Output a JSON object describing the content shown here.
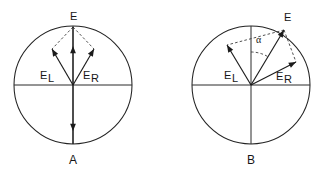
{
  "figure": {
    "background_color": "#ffffff",
    "line_color": "#1b1b1b",
    "dashed_color": "#3d3d3d",
    "width": 328,
    "height": 176,
    "panels": [
      {
        "id": "panel-a",
        "caption": "A",
        "caption_x": 73,
        "caption_y": 161,
        "circle": {
          "cx": 73,
          "cy": 85,
          "r": 59
        },
        "axes": {
          "horizontal": {
            "x1": 14,
            "y1": 85,
            "x2": 132,
            "y2": 85
          },
          "vertical": {
            "x1": 73,
            "y1": 26,
            "x2": 73,
            "y2": 144
          }
        },
        "vectors": [
          {
            "name": "E",
            "label": "E",
            "label_sub": "",
            "label_x": 70,
            "label_y": 17,
            "x1": 73,
            "y1": 85,
            "x2": 73,
            "y2": 27,
            "head_x": 73,
            "head_y": 46,
            "head_angle_deg": -90,
            "head_on_midpoint": true
          },
          {
            "name": "E_L",
            "label": "E",
            "label_sub": "L",
            "label_x": 40,
            "label_y": 76,
            "x1": 73,
            "y1": 85,
            "x2": 52,
            "y2": 49,
            "head_x": 52,
            "head_y": 49,
            "head_angle_deg": -120,
            "head_on_midpoint": false
          },
          {
            "name": "E_R",
            "label": "E",
            "label_sub": "R",
            "label_x": 83,
            "label_y": 76,
            "x1": 73,
            "y1": 85,
            "x2": 94,
            "y2": 49,
            "head_x": 94,
            "head_y": 49,
            "head_angle_deg": -60,
            "head_on_midpoint": false
          },
          {
            "name": "A-axis-down",
            "label": "",
            "label_sub": "",
            "label_x": 0,
            "label_y": 0,
            "x1": 73,
            "y1": 85,
            "x2": 73,
            "y2": 144,
            "head_x": 73,
            "head_y": 131,
            "head_angle_deg": 90,
            "head_on_midpoint": true
          }
        ],
        "dashed_lines": [
          {
            "name": "dash-E-to-EL",
            "x1": 73,
            "y1": 27,
            "x2": 52,
            "y2": 49
          },
          {
            "name": "dash-E-to-ER",
            "x1": 73,
            "y1": 27,
            "x2": 94,
            "y2": 49
          }
        ],
        "angle_marker": null
      },
      {
        "id": "panel-b",
        "caption": "B",
        "caption_x": 251,
        "caption_y": 161,
        "circle": {
          "cx": 251,
          "cy": 85,
          "r": 59
        },
        "axes": {
          "horizontal": {
            "x1": 192,
            "y1": 85,
            "x2": 310,
            "y2": 85
          },
          "vertical": {
            "x1": 251,
            "y1": 26,
            "x2": 251,
            "y2": 144
          }
        },
        "vectors": [
          {
            "name": "E",
            "label": "E",
            "label_sub": "",
            "label_x": 284,
            "label_y": 18,
            "x1": 251,
            "y1": 85,
            "x2": 284,
            "y2": 30,
            "head_x": 284,
            "head_y": 30,
            "head_angle_deg": -59,
            "head_on_midpoint": false
          },
          {
            "name": "E_L",
            "label": "E",
            "label_sub": "L",
            "label_x": 224,
            "label_y": 76,
            "x1": 251,
            "y1": 85,
            "x2": 227,
            "y2": 45,
            "head_x": 227,
            "head_y": 45,
            "head_angle_deg": -121,
            "head_on_midpoint": false
          },
          {
            "name": "E_R",
            "label": "E",
            "label_sub": "R",
            "label_x": 276,
            "label_y": 77,
            "x1": 251,
            "y1": 85,
            "x2": 296,
            "y2": 62,
            "head_x": 296,
            "head_y": 62,
            "head_angle_deg": -27,
            "head_on_midpoint": false
          }
        ],
        "dashed_lines": [
          {
            "name": "dash-E-to-EL",
            "x1": 284,
            "y1": 30,
            "x2": 227,
            "y2": 45
          },
          {
            "name": "dash-E-to-ER",
            "x1": 284,
            "y1": 30,
            "x2": 296,
            "y2": 62
          }
        ],
        "angle_marker": {
          "name": "alpha-angle",
          "label": "α",
          "label_x": 256,
          "label_y": 41,
          "arc": {
            "cx": 251,
            "cy": 85,
            "r": 33,
            "start_deg": -90,
            "end_deg": -59
          }
        }
      }
    ]
  }
}
